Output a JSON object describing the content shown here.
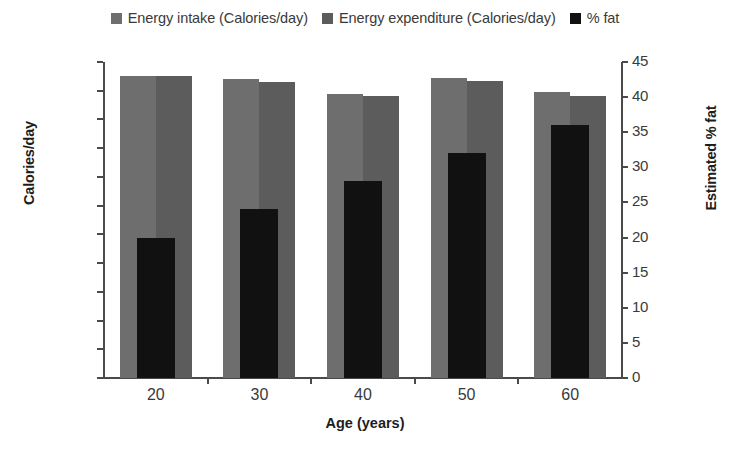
{
  "legend": {
    "items": [
      {
        "label": "Energy intake (Calories/day)",
        "color": "#6e6e6e",
        "swatch_name": "legend-swatch-energy-intake"
      },
      {
        "label": "Energy expenditure (Calories/day)",
        "color": "#5c5c5c",
        "swatch_name": "legend-swatch-energy-expenditure"
      },
      {
        "label": "% fat",
        "color": "#111111",
        "swatch_name": "legend-swatch-percent-fat"
      }
    ]
  },
  "axes": {
    "left_title": "Calories/day",
    "right_title": "Estimated % fat",
    "x_title": "Age (years)",
    "left_ticks": [
      "2,100",
      "2,000",
      "1,900",
      "1,800",
      "1,700",
      "1,600",
      "1,500",
      "1,400",
      "1,300",
      "1,200",
      "1,100",
      "1,000"
    ],
    "right_ticks": [
      "45",
      "40",
      "35",
      "30",
      "25",
      "20",
      "15",
      "10",
      "5",
      "0"
    ],
    "x_ticks": [
      "20",
      "30",
      "40",
      "50",
      "60"
    ]
  },
  "chart_data": {
    "type": "bar",
    "title": "",
    "xlabel": "Age (years)",
    "ylabel": "Calories/day",
    "y2label": "Estimated % fat",
    "categories": [
      "20",
      "30",
      "40",
      "50",
      "60"
    ],
    "ylim": [
      1000,
      2100
    ],
    "y2lim": [
      0,
      45
    ],
    "ytick_step": 100,
    "y2tick_step": 5,
    "grid": false,
    "legend_position": "top",
    "series": [
      {
        "name": "Energy intake (Calories/day)",
        "axis": "left",
        "color": "#6e6e6e",
        "values": [
          2050,
          2040,
          1990,
          2045,
          1995
        ]
      },
      {
        "name": "Energy expenditure (Calories/day)",
        "axis": "left",
        "color": "#5c5c5c",
        "values": [
          2050,
          2030,
          1980,
          2035,
          1980
        ]
      },
      {
        "name": "% fat",
        "axis": "right",
        "color": "#111111",
        "values": [
          20,
          24,
          28,
          32,
          36
        ]
      }
    ]
  }
}
